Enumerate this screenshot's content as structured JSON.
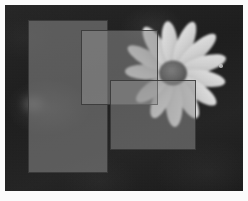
{
  "image": {
    "title": "Daisy flower photograph with three overlapping translucent rectangles",
    "frame_color": "#fbfbfb",
    "frame_width_px": 5,
    "canvas_width_px": 248,
    "canvas_height_px": 201,
    "photo_width_px": 238,
    "photo_height_px": 186,
    "background_color": "#1f1f1f",
    "background_description": "dark mottled out-of-focus foliage"
  },
  "subject": {
    "name": "daisy-flower",
    "center_x_px": 173,
    "center_y_px": 73,
    "disc_color": "#5e5e5e",
    "disc_radius_px": 13,
    "petal_color": "#d8d8d8",
    "petal_count": 13,
    "description": "white daisy with radiating petals, center disc in upper right of frame"
  },
  "highlights": [
    {
      "name": "bokeh-speck-right",
      "x_px": 219,
      "y_px": 64,
      "size_px": 3,
      "color": "#dcdcdc"
    },
    {
      "name": "bokeh-blur-left",
      "x_px": 30,
      "y_px": 103,
      "size_px": 14,
      "color": "#6a6a6a"
    }
  ],
  "overlays": {
    "label": "Overlapping translucent rectangles",
    "rects": [
      {
        "name": "rect-tall-left",
        "x_px": 28,
        "y_px": 20,
        "width_px": 80,
        "height_px": 153,
        "fill": "#7a7a7a",
        "opacity": 0.62,
        "border_color": "#3a3a3a",
        "border_width_px": 1,
        "z_order": 1
      },
      {
        "name": "rect-middle-upper",
        "x_px": 81,
        "y_px": 30,
        "width_px": 77,
        "height_px": 75,
        "fill": "#8a8a8a",
        "opacity": 0.55,
        "border_color": "#3a3a3a",
        "border_width_px": 1,
        "z_order": 2
      },
      {
        "name": "rect-wide-lower-right",
        "x_px": 110,
        "y_px": 80,
        "width_px": 86,
        "height_px": 70,
        "fill": "#909090",
        "opacity": 0.5,
        "border_color": "#3a3a3a",
        "border_width_px": 1,
        "z_order": 3
      }
    ]
  }
}
